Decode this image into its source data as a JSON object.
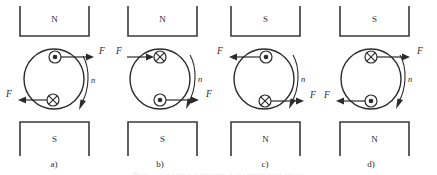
{
  "figure": {
    "caption_partial": "Рис. — рамка с током в магнитном поле",
    "colors": {
      "ink": "#2b2b2b",
      "pole": "#3a3a3a",
      "background": "#ffffff"
    }
  },
  "panels": [
    {
      "id": "a",
      "caption": "a)",
      "top_pole": "N",
      "bottom_pole": "S",
      "rotation_label": "n",
      "rotation_direction": "clockwise",
      "conductors": [
        {
          "position": "top",
          "symbol": "dot",
          "symbol_name": "current-out-of-page",
          "force_label": "F",
          "force_direction": "right"
        },
        {
          "position": "bottom",
          "symbol": "cross",
          "symbol_name": "current-into-page",
          "force_label": "F",
          "force_direction": "left"
        }
      ]
    },
    {
      "id": "b",
      "caption": "b)",
      "top_pole": "N",
      "bottom_pole": "S",
      "rotation_label": "n",
      "rotation_direction": "clockwise",
      "conductors": [
        {
          "position": "top",
          "symbol": "cross",
          "symbol_name": "current-into-page",
          "force_label": "F",
          "force_direction": "right"
        },
        {
          "position": "bottom",
          "symbol": "dot",
          "symbol_name": "current-out-of-page",
          "force_label": "F",
          "force_direction": "right"
        }
      ]
    },
    {
      "id": "c",
      "caption": "c)",
      "top_pole": "S",
      "bottom_pole": "N",
      "rotation_label": "n",
      "rotation_direction": "clockwise",
      "conductors": [
        {
          "position": "top",
          "symbol": "dot",
          "symbol_name": "current-out-of-page",
          "force_label": "F",
          "force_direction": "left"
        },
        {
          "position": "bottom",
          "symbol": "cross",
          "symbol_name": "current-into-page",
          "force_label": "F",
          "force_direction": "right"
        }
      ]
    },
    {
      "id": "d",
      "caption": "d)",
      "top_pole": "S",
      "bottom_pole": "N",
      "rotation_label": "n",
      "rotation_direction": "clockwise",
      "conductors": [
        {
          "position": "top",
          "symbol": "cross",
          "symbol_name": "current-into-page",
          "force_label": "F",
          "force_direction": "right"
        },
        {
          "position": "bottom",
          "symbol": "dot",
          "symbol_name": "current-out-of-page",
          "force_label": "F",
          "force_direction": "left"
        }
      ]
    }
  ]
}
